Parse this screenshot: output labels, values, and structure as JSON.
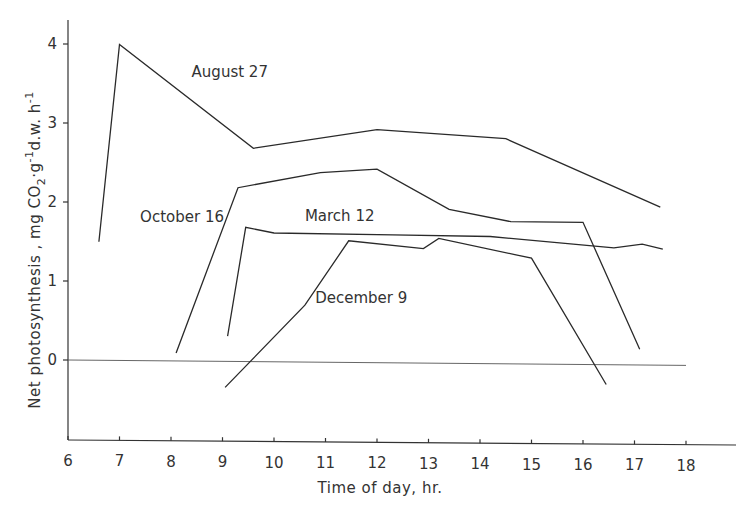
{
  "chart_data": {
    "type": "line",
    "title": "",
    "xlabel": "Time of day, hr.",
    "ylabel": "Net photosynthesis , mg CO2·g-1d.w.h-1",
    "xlim": [
      6,
      19
    ],
    "ylim": [
      -0.7,
      4.3
    ],
    "x_ticks": [
      6,
      7,
      8,
      9,
      10,
      11,
      12,
      13,
      14,
      15,
      16,
      17,
      18
    ],
    "y_ticks": [
      0,
      1,
      2,
      3,
      4
    ],
    "grid": false,
    "legend": "inline labels",
    "reference_line": {
      "y": 0,
      "x_range": [
        6,
        18
      ]
    },
    "series": [
      {
        "name": "August 27",
        "label_pos": [
          8.4,
          3.6
        ],
        "points": [
          [
            6.6,
            1.5
          ],
          [
            7.0,
            4.0
          ],
          [
            9.6,
            2.7
          ],
          [
            12.0,
            2.95
          ],
          [
            14.5,
            2.85
          ],
          [
            17.5,
            2.0
          ]
        ]
      },
      {
        "name": "October 16",
        "label_pos": [
          7.4,
          1.75
        ],
        "points": [
          [
            8.1,
            0.1
          ],
          [
            9.3,
            2.2
          ],
          [
            10.9,
            2.4
          ],
          [
            12.0,
            2.45
          ],
          [
            13.4,
            1.95
          ],
          [
            14.6,
            1.8
          ],
          [
            16.0,
            1.8
          ],
          [
            17.1,
            0.2
          ]
        ]
      },
      {
        "name": "March 12",
        "label_pos": [
          10.6,
          1.78
        ],
        "points": [
          [
            9.1,
            0.32
          ],
          [
            9.45,
            1.7
          ],
          [
            10.0,
            1.63
          ],
          [
            12.3,
            1.62
          ],
          [
            14.2,
            1.61
          ],
          [
            16.6,
            1.48
          ],
          [
            17.15,
            1.53
          ],
          [
            17.55,
            1.47
          ]
        ]
      },
      {
        "name": "December 9",
        "label_pos": [
          10.8,
          0.75
        ],
        "points": [
          [
            9.05,
            -0.33
          ],
          [
            10.6,
            0.72
          ],
          [
            11.45,
            1.54
          ],
          [
            12.9,
            1.45
          ],
          [
            13.2,
            1.58
          ],
          [
            15.0,
            1.34
          ],
          [
            16.45,
            -0.25
          ]
        ]
      }
    ]
  },
  "axes": {
    "x_title": "Time of day, hr.",
    "y_title_main": "Net photosynthesis ,  mg CO",
    "y_title_sub2": "2",
    "y_title_g": "·g",
    "y_title_sup1": "-1",
    "y_title_dw": "d.w. h",
    "y_title_sup2": "-1"
  }
}
